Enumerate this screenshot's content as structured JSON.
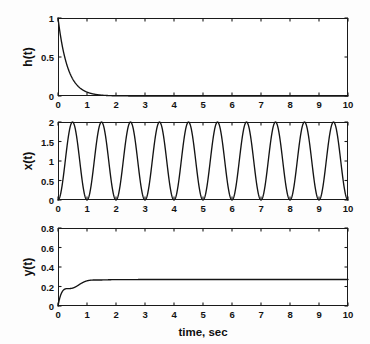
{
  "figure": {
    "title": "",
    "background_color": "#fdfdfd",
    "line_color": "#141414",
    "axis_color": "#1a1a1a"
  },
  "chart_data": [
    {
      "type": "line",
      "name": "impulse-response",
      "title": "",
      "xlabel": "",
      "ylabel": "h(t)",
      "xlim": [
        0,
        10
      ],
      "ylim": [
        0,
        1
      ],
      "xticks": [
        0,
        1,
        2,
        3,
        4,
        5,
        6,
        7,
        8,
        9,
        10
      ],
      "xticklabels": [
        "0",
        "1",
        "2",
        "3",
        "4",
        "5",
        "6",
        "7",
        "8",
        "9",
        "10"
      ],
      "yticks": [
        0,
        0.5,
        1
      ],
      "yticklabels": [
        "0",
        "0.5",
        "1"
      ],
      "grid": false,
      "legend": null,
      "equation": "h(t) = exp(-3t)",
      "series": [
        {
          "name": "h(t)",
          "x": [
            0,
            0.1,
            0.2,
            0.3,
            0.4,
            0.5,
            0.6,
            0.7,
            0.8,
            0.9,
            1.0,
            1.2,
            1.4,
            1.6,
            1.8,
            2.0,
            2.5,
            3.0,
            4.0,
            5.0,
            6.0,
            7.0,
            8.0,
            9.0,
            10.0
          ],
          "values": [
            1.0,
            0.741,
            0.549,
            0.407,
            0.301,
            0.223,
            0.165,
            0.122,
            0.091,
            0.067,
            0.05,
            0.027,
            0.015,
            0.008,
            0.0045,
            0.0025,
            0.00055,
            0.00012,
            0.0,
            0.0,
            0.0,
            0.0,
            0.0,
            0.0,
            0.0
          ]
        }
      ]
    },
    {
      "type": "line",
      "name": "input-signal",
      "title": "",
      "xlabel": "",
      "ylabel": "x(t)",
      "xlim": [
        0,
        10
      ],
      "ylim": [
        0,
        2
      ],
      "xticks": [
        0,
        1,
        2,
        3,
        4,
        5,
        6,
        7,
        8,
        9,
        10
      ],
      "xticklabels": [
        "0",
        "1",
        "2",
        "3",
        "4",
        "5",
        "6",
        "7",
        "8",
        "9",
        "10"
      ],
      "yticks": [
        0,
        0.5,
        1,
        1.5,
        2
      ],
      "yticklabels": [
        "0",
        "0.5",
        "1",
        "1.5",
        "2"
      ],
      "grid": false,
      "legend": null,
      "equation": "x(t) = 1 - cos(2*pi*t)",
      "series": [
        {
          "name": "x(t)",
          "period_sec": 1.0,
          "amplitude": 1.0,
          "offset": 1.0,
          "min": 0.0,
          "max": 2.0,
          "peaks_at": [
            0.5,
            1.5,
            2.5,
            3.5,
            4.5,
            5.5,
            6.5,
            7.5,
            8.5,
            9.5
          ],
          "troughs_at": [
            0,
            1,
            2,
            3,
            4,
            5,
            6,
            7,
            8,
            9,
            10
          ]
        }
      ]
    },
    {
      "type": "line",
      "name": "output-response",
      "title": "",
      "xlabel": "time, sec",
      "ylabel": "y(t)",
      "xlim": [
        0,
        10
      ],
      "ylim": [
        0,
        0.8
      ],
      "xticks": [
        0,
        1,
        2,
        3,
        4,
        5,
        6,
        7,
        8,
        9,
        10
      ],
      "xticklabels": [
        "0",
        "1",
        "2",
        "3",
        "4",
        "5",
        "6",
        "7",
        "8",
        "9",
        "10"
      ],
      "yticks": [
        0,
        0.2,
        0.4,
        0.6,
        0.8
      ],
      "yticklabels": [
        "0",
        "0.2",
        "0.4",
        "0.6",
        "0.8"
      ],
      "grid": false,
      "legend": null,
      "equation": "y(t) = x(t) * h(t) convolution",
      "series": [
        {
          "name": "y(t)",
          "initial_value": 0.0,
          "first_peak_value": 0.55,
          "first_peak_time": 0.75,
          "steady_state_mean": 0.5,
          "steady_state_max": 0.66,
          "steady_state_min": 0.335,
          "period_sec": 1.0
        }
      ]
    }
  ]
}
